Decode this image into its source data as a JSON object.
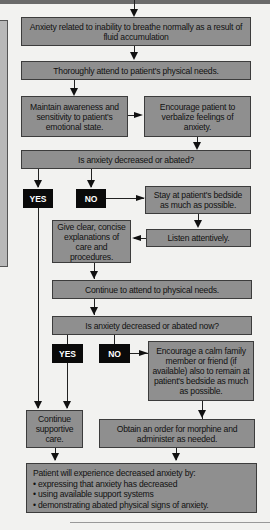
{
  "flowchart": {
    "nodes": {
      "problem": "Anxiety related to inability to breathe normally as a result of fluid accumulation",
      "attend_needs": "Thoroughly attend to patient's physical needs.",
      "awareness": "Maintain awareness and sensitivity to patient's emotional state.",
      "verbalize": "Encourage patient to verbalize feelings of anxiety.",
      "question1": "Is anxiety decreased or abated?",
      "yes1": "YES",
      "no1": "NO",
      "stay_bedside": "Stay at patient's bedside as much as possible.",
      "listen": "Listen attentively.",
      "explain": "Give clear, concise explanations of care and procedures.",
      "continue_needs": "Continue to attend to physical needs.",
      "question2": "Is anxiety decreased or abated now?",
      "yes2": "YES",
      "no2": "NO",
      "family": "Encourage a calm family member or friend (if available) also to remain at patient's bedside as much as possible.",
      "supportive": "Continue supportive care.",
      "morphine": "Obtain an order for morphine and administer as needed.",
      "outcome_title": "Patient will experience decreased anxiety by:",
      "outcome_items": [
        "• expressing that anxiety has decreased",
        "• using available support systems",
        "• demonstrating abated physical signs of anxiety."
      ]
    },
    "colors": {
      "box_fill": "#8f8f8f",
      "box_border": "#3c3c3c",
      "tag_fill": "#0a0a0a",
      "tag_text": "#ffffff",
      "background": "#f2f2f0"
    }
  }
}
